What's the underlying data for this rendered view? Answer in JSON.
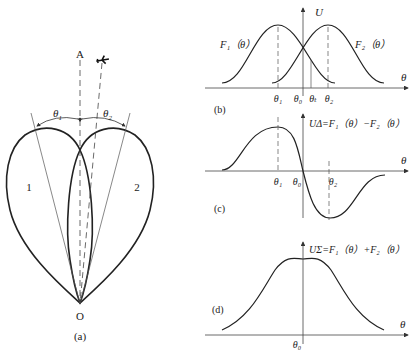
{
  "panel_a": {
    "caption": "(a)",
    "axis_label": "A",
    "origin_label": "O",
    "lobe_1_label": "1",
    "lobe_2_label": "2",
    "theta1": "θ",
    "theta1_sub": "1",
    "theta2": "θ",
    "theta2_sub": "2",
    "target_icon": "airplane-icon"
  },
  "panel_b": {
    "caption": "(b)",
    "y_axis": "U",
    "x_axis": "θ",
    "curve_1": "F₁（θ）",
    "curve_2": "F₂（θ）",
    "ticks": [
      "θ₁",
      "θ₀",
      "θₜ",
      "θ₂"
    ]
  },
  "panel_c": {
    "caption": "(c)",
    "formula": "UΔ=F₁（θ）−F₂（θ）",
    "x_axis": "θ",
    "ticks": [
      "θ₁",
      "θ₀",
      "θ₂"
    ]
  },
  "panel_d": {
    "caption": "(d)",
    "formula": "UΣ=F₁（θ）+F₂（θ）",
    "x_axis": "θ",
    "ticks": [
      "θ₀"
    ]
  }
}
